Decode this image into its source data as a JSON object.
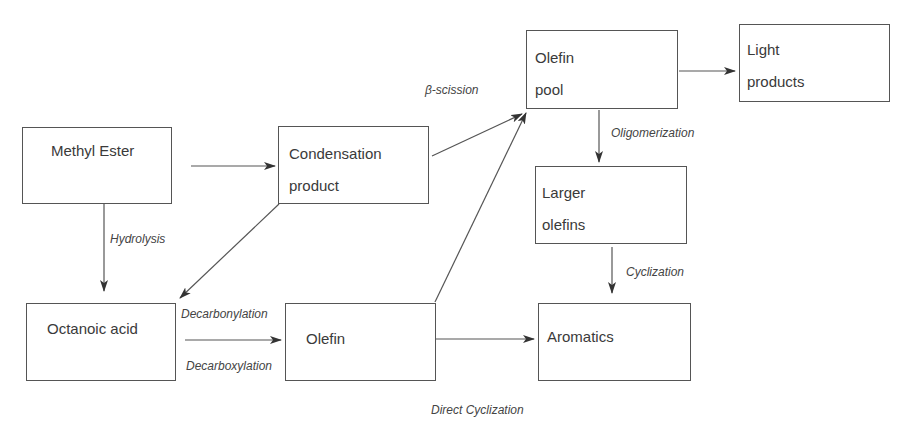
{
  "diagram": {
    "type": "reaction-pathway-flowchart",
    "colors": {
      "line": "#555555",
      "text": "#3a3a3a",
      "background": "#ffffff"
    },
    "nodes": {
      "methyl_ester": {
        "lines": [
          "Methyl Ester"
        ]
      },
      "condensation_product": {
        "lines": [
          "Condensation",
          "product"
        ]
      },
      "olefin_pool": {
        "lines": [
          "Olefin",
          "pool"
        ]
      },
      "light_products": {
        "lines": [
          "Light",
          "products"
        ]
      },
      "larger_olefins": {
        "lines": [
          "Larger",
          "olefins"
        ]
      },
      "octanoic_acid": {
        "lines": [
          "Octanoic acid"
        ]
      },
      "olefin": {
        "lines": [
          "Olefin"
        ]
      },
      "aromatics": {
        "lines": [
          "Aromatics"
        ]
      }
    },
    "edge_labels": {
      "beta_scission": "β-scission",
      "oligomerization": "Oligomerization",
      "hydrolysis": "Hydrolysis",
      "cyclization": "Cyclization",
      "decarbonylation": "Decarbonylation",
      "decarboxylation": "Decarboxylation",
      "direct_cyclization": "Direct Cyclization"
    },
    "edges": [
      {
        "from": "Methyl Ester",
        "to": "Condensation product",
        "label": ""
      },
      {
        "from": "Methyl Ester",
        "to": "Octanoic acid",
        "label": "Hydrolysis"
      },
      {
        "from": "Condensation product",
        "to": "Olefin pool",
        "label": "β-scission"
      },
      {
        "from": "Condensation product",
        "to": "Octanoic acid",
        "label": ""
      },
      {
        "from": "Octanoic acid",
        "to": "Olefin",
        "label": "Decarbonylation / Decarboxylation"
      },
      {
        "from": "Olefin",
        "to": "Olefin pool",
        "label": ""
      },
      {
        "from": "Olefin",
        "to": "Aromatics",
        "label": "Direct Cyclization"
      },
      {
        "from": "Olefin pool",
        "to": "Light products",
        "label": ""
      },
      {
        "from": "Olefin pool",
        "to": "Larger olefins",
        "label": "Oligomerization"
      },
      {
        "from": "Larger olefins",
        "to": "Aromatics",
        "label": "Cyclization"
      }
    ]
  }
}
